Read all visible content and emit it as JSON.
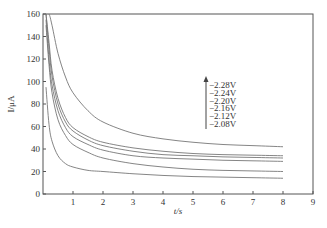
{
  "chart_data": {
    "type": "line",
    "title": "",
    "xlabel": "t/s",
    "ylabel": "I/μA",
    "xlim": [
      0,
      9
    ],
    "ylim": [
      0,
      160
    ],
    "xticks": [
      1,
      2,
      3,
      4,
      5,
      6,
      7,
      8,
      9
    ],
    "yticks": [
      0,
      20,
      40,
      60,
      80,
      100,
      120,
      140,
      160
    ],
    "grid": false,
    "legend_position": "center-right, inside plot (with upward arrow indicating increasing potential magnitude)",
    "legend_arrow": "up",
    "x": [
      0.1,
      0.2,
      0.3,
      0.5,
      0.75,
      1,
      1.5,
      2,
      3,
      4,
      5,
      6,
      7,
      8
    ],
    "series": [
      {
        "name": "-2.28V",
        "values": [
          160,
          160,
          150,
          125,
          104,
          90,
          74,
          64,
          54,
          49,
          46,
          44,
          43,
          42
        ]
      },
      {
        "name": "-2.24V",
        "values": [
          160,
          135,
          110,
          85,
          68,
          59,
          51,
          46,
          41,
          38,
          36,
          35,
          34.5,
          34
        ]
      },
      {
        "name": "-2.20V",
        "values": [
          160,
          130,
          105,
          80,
          64,
          56,
          48,
          43,
          38,
          35,
          34,
          33,
          32.5,
          32
        ]
      },
      {
        "name": "-2.16V",
        "values": [
          155,
          120,
          97,
          74,
          59,
          51,
          44,
          39,
          34,
          32,
          31,
          30,
          29.5,
          29
        ]
      },
      {
        "name": "-2.12V",
        "values": [
          150,
          115,
          90,
          66,
          52,
          44,
          37,
          32,
          27,
          24,
          22,
          21,
          20.5,
          20
        ]
      },
      {
        "name": "-2.08V",
        "values": [
          95,
          62,
          47,
          34,
          27,
          24,
          21,
          20,
          18,
          16.5,
          15.5,
          15,
          14.5,
          14
        ]
      }
    ]
  },
  "axes": {
    "xlabel": "t/s",
    "ylabel": "I/μA",
    "xticks": [
      "1",
      "2",
      "3",
      "4",
      "5",
      "6",
      "7",
      "8",
      "9"
    ],
    "yticks": [
      "0",
      "20",
      "40",
      "60",
      "80",
      "100",
      "120",
      "140",
      "160"
    ]
  },
  "legend": {
    "items": [
      "−2.28V",
      "−2.24V",
      "−2.20V",
      "−2.16V",
      "−2.12V",
      "−2.08V"
    ]
  },
  "colors": {
    "axis": "#555555",
    "line": "#777777",
    "text": "#333333"
  }
}
